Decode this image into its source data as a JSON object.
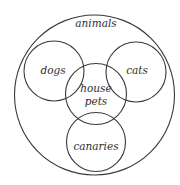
{
  "diagram": {
    "type": "venn-euler",
    "colors": {
      "stroke": "#3a3a3a",
      "text": "#2e2e2e",
      "background": "#ffffff"
    },
    "sets": [
      {
        "id": "animals",
        "label": "animals",
        "cx": 94.5,
        "cy": 95,
        "r": 80,
        "label_x": 96,
        "label_y": 24
      },
      {
        "id": "dogs",
        "label": "dogs",
        "cx": 54,
        "cy": 71,
        "r": 30,
        "label_x": 53,
        "label_y": 71
      },
      {
        "id": "cats",
        "label": "cats",
        "cx": 136,
        "cy": 72,
        "r": 30,
        "label_x": 137,
        "label_y": 71
      },
      {
        "id": "house-pets",
        "label_line1": "house",
        "label_line2": "pets",
        "cx": 96,
        "cy": 94,
        "r": 30.5,
        "label_x": 96,
        "label_y1": 89,
        "label_y2": 102
      },
      {
        "id": "canaries",
        "label": "canaries",
        "cx": 96,
        "cy": 142,
        "r": 29.5,
        "label_x": 96,
        "label_y": 147
      }
    ]
  }
}
